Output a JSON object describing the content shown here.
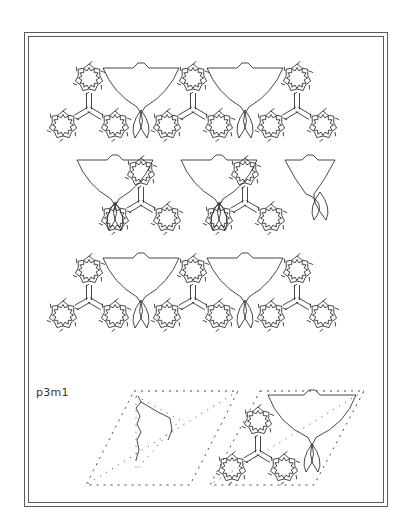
{
  "figure": {
    "group_label": "p3m1",
    "stroke_color": "#1a1a1a",
    "frame_color": "#5a5a5a",
    "background": "#ffffff"
  },
  "pattern": {
    "rosette_radius_inner": 8,
    "rosette_radius_outer": 14,
    "rosette_spikes": 12,
    "rosettes": [
      [
        89,
        78
      ],
      [
        193,
        78
      ],
      [
        297,
        78
      ],
      [
        63,
        125
      ],
      [
        115,
        125
      ],
      [
        167,
        125
      ],
      [
        219,
        125
      ],
      [
        271,
        125
      ],
      [
        323,
        125
      ],
      [
        141,
        172
      ],
      [
        245,
        172
      ],
      [
        115,
        218
      ],
      [
        167,
        218
      ],
      [
        219,
        218
      ],
      [
        271,
        218
      ],
      [
        89,
        270
      ],
      [
        193,
        270
      ],
      [
        297,
        270
      ],
      [
        63,
        315
      ],
      [
        115,
        315
      ],
      [
        167,
        315
      ],
      [
        219,
        315
      ],
      [
        271,
        315
      ],
      [
        323,
        315
      ]
    ],
    "trefoils": [
      [
        89,
        78,
        63,
        125,
        115,
        125
      ],
      [
        193,
        78,
        167,
        125,
        219,
        125
      ],
      [
        297,
        78,
        271,
        125,
        323,
        125
      ],
      [
        141,
        172,
        115,
        218,
        167,
        218
      ],
      [
        245,
        172,
        219,
        218,
        271,
        218
      ],
      [
        89,
        270,
        63,
        315,
        115,
        315
      ],
      [
        193,
        270,
        167,
        315,
        219,
        315
      ],
      [
        297,
        270,
        271,
        315,
        323,
        315
      ]
    ],
    "lattice_triangles": [
      [
        103,
        68,
        179,
        68,
        141,
        138
      ],
      [
        207,
        68,
        283,
        68,
        245,
        138
      ],
      [
        77,
        160,
        153,
        160,
        115,
        230
      ],
      [
        181,
        160,
        257,
        160,
        219,
        230
      ],
      [
        285,
        160,
        335,
        160,
        320,
        220
      ],
      [
        103,
        258,
        179,
        258,
        141,
        328
      ],
      [
        207,
        258,
        283,
        258,
        245,
        328
      ]
    ]
  },
  "unit_cells": [
    {
      "name": "fundamental-region-cell",
      "corners": [
        [
          134,
          391
        ],
        [
          238,
          391
        ],
        [
          190,
          485
        ],
        [
          86,
          485
        ]
      ],
      "partial_motif": true,
      "fragment": [
        [
          138,
          396
        ],
        [
          141,
          402
        ],
        [
          136,
          408
        ],
        [
          140,
          416
        ],
        [
          137,
          424
        ],
        [
          141,
          432
        ],
        [
          137,
          440
        ],
        [
          139,
          450
        ],
        [
          136,
          460
        ]
      ],
      "arc": [
        [
          141,
          402
        ],
        [
          158,
          412
        ],
        [
          170,
          418
        ],
        [
          172,
          430
        ],
        [
          168,
          440
        ]
      ]
    },
    {
      "name": "full-motif-cell",
      "corners": [
        [
          260,
          391
        ],
        [
          364,
          391
        ],
        [
          314,
          485
        ],
        [
          210,
          485
        ]
      ],
      "partial_motif": false,
      "rosettes": [
        [
          258,
          421
        ],
        [
          232,
          468
        ],
        [
          284,
          468
        ]
      ],
      "triangle": [
        268,
        395,
        356,
        395,
        312,
        472
      ]
    }
  ]
}
